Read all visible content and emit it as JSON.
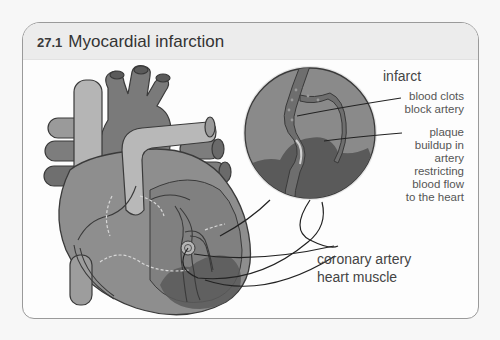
{
  "figure": {
    "number": "27.1",
    "title": "Myocardial infarction"
  },
  "labels": {
    "inset_heading": "infarct",
    "blood_clots": "blood clots block artery",
    "plaque": "plaque buildup in artery restricting blood flow to the heart",
    "coronary_artery": "coronary artery",
    "heart_muscle": "heart muscle"
  },
  "colors": {
    "heart_dark": "#6d6d6d",
    "heart_mid": "#8a8a8a",
    "vessel_light": "#b5b5b5",
    "infarct_dark": "#4f4f4f",
    "outline": "#3a3a3a"
  }
}
